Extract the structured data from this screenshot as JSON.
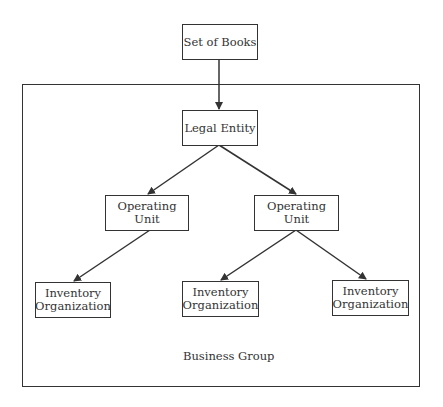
{
  "diagram": {
    "nodes": {
      "set_of_books": "Set of Books",
      "legal_entity": "Legal Entity",
      "operating_unit_left": "Operating Unit",
      "operating_unit_right": "Operating Unit",
      "inventory_org_1_line1": "Inventory",
      "inventory_org_1_line2": "Organization",
      "inventory_org_2_line1": "Inventory",
      "inventory_org_2_line2": "Organization",
      "inventory_org_3_line1": "Inventory",
      "inventory_org_3_line2": "Organization"
    },
    "container_label": "Business Group",
    "edges": [
      {
        "from": "Set of Books",
        "to": "Legal Entity"
      },
      {
        "from": "Legal Entity",
        "to": "Operating Unit (left)"
      },
      {
        "from": "Legal Entity",
        "to": "Operating Unit (right)"
      },
      {
        "from": "Operating Unit (left)",
        "to": "Inventory Organization 1"
      },
      {
        "from": "Operating Unit (right)",
        "to": "Inventory Organization 2"
      },
      {
        "from": "Operating Unit (right)",
        "to": "Inventory Organization 3"
      }
    ],
    "colors": {
      "line": "#333333",
      "background": "#ffffff"
    }
  }
}
